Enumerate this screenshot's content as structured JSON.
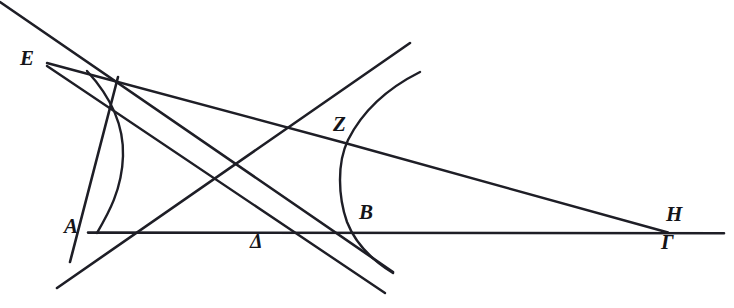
{
  "figure": {
    "background_color": "#ffffff",
    "ink_color": "#1e1e26",
    "width": 734,
    "height": 308,
    "labels": [
      {
        "id": "E",
        "text": "E",
        "x": 20,
        "y": 50,
        "point_x": 48,
        "point_y": 64
      },
      {
        "id": "Z",
        "text": "Z",
        "x": 333,
        "y": 116,
        "point_x": 345,
        "point_y": 143
      },
      {
        "id": "A",
        "text": "A",
        "x": 64,
        "y": 218,
        "point_x": 97,
        "point_y": 232
      },
      {
        "id": "B",
        "text": "B",
        "x": 359,
        "y": 204,
        "point_x": 360,
        "point_y": 233
      },
      {
        "id": "H",
        "text": "H",
        "x": 666,
        "y": 206,
        "point_x": 668,
        "point_y": 232
      },
      {
        "id": "Gamma",
        "text": "Γ",
        "x": 661,
        "y": 233,
        "point_x": 668,
        "point_y": 234
      },
      {
        "id": "Delta",
        "text": "Δ",
        "x": 251,
        "y": 232,
        "point_x": 262,
        "point_y": 243
      }
    ],
    "elements": {
      "baseline": "horizontal-base-line-A-to-Gamma",
      "curve_left": "hyperbola-branch-through-A",
      "curve_right": "hyperbola-branch-through-Z-and-B",
      "ray_E_to_Z": "straight-line-E-to-Z-to-right-edge",
      "ray_E_to_H": "straight-line-E-to-H",
      "ray_E_down": "straight-line-E-down-right",
      "line_topleft": "straight-line-from-top-left-corner",
      "line_lower_left_up": "straight-line-lower-left-to-upper-right"
    }
  }
}
